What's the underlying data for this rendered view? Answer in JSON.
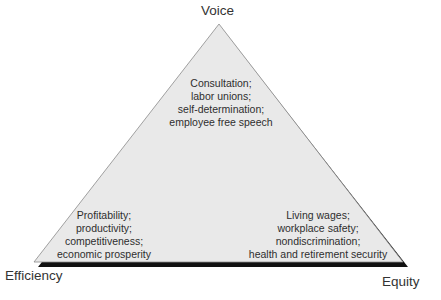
{
  "diagram": {
    "type": "triangle",
    "colors": {
      "fill": "#e9e9e9",
      "outline": "#888888",
      "shadow": "#111111"
    },
    "vertices": {
      "top": {
        "label": "Voice"
      },
      "bottom_left": {
        "label": "Efficiency"
      },
      "bottom_right": {
        "label": "Equity"
      }
    },
    "blocks": {
      "voice": [
        "Consultation;",
        "labor unions;",
        "self-determination;",
        "employee free speech"
      ],
      "efficiency": [
        "Profitability;",
        "productivity;",
        "competitiveness;",
        "economic prosperity"
      ],
      "equity": [
        "Living wages;",
        "workplace safety;",
        "nondiscrimination;",
        "health and retirement security"
      ]
    }
  }
}
